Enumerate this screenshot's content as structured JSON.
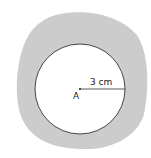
{
  "diagram": {
    "center_label": "A",
    "radius_label": "3 cm",
    "colors": {
      "shaded_region": "#cccccc",
      "circle_fill": "#ffffff",
      "stroke": "#333333"
    }
  }
}
